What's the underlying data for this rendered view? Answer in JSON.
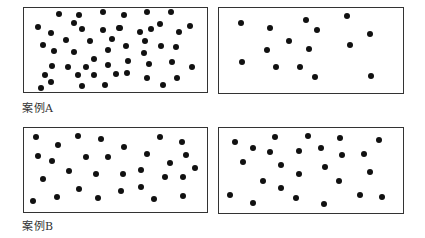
{
  "cases": [
    {
      "label": "案例A",
      "label_pos": [
        22,
        99
      ],
      "panels": [
        {
          "name": "case-a-dense",
          "box": [
            23,
            7,
            185,
            86
          ],
          "dots": [
            [
              59,
              14
            ],
            [
              79,
              15
            ],
            [
              103,
              12
            ],
            [
              124,
              15
            ],
            [
              147,
              12
            ],
            [
              171,
              12
            ],
            [
              38,
              27
            ],
            [
              74,
              23
            ],
            [
              82,
              29
            ],
            [
              103,
              30
            ],
            [
              119,
              28
            ],
            [
              120,
              28
            ],
            [
              140,
              32
            ],
            [
              151,
              29
            ],
            [
              160,
              24
            ],
            [
              179,
              32
            ],
            [
              190,
              26
            ],
            [
              51,
              33
            ],
            [
              66,
              40
            ],
            [
              90,
              41
            ],
            [
              112,
              39
            ],
            [
              145,
              41
            ],
            [
              43,
              45
            ],
            [
              54,
              51
            ],
            [
              74,
              52
            ],
            [
              108,
              50
            ],
            [
              126,
              46
            ],
            [
              161,
              46
            ],
            [
              176,
              47
            ],
            [
              144,
              53
            ],
            [
              94,
              59
            ],
            [
              52,
              66
            ],
            [
              68,
              67
            ],
            [
              86,
              67
            ],
            [
              108,
              65
            ],
            [
              128,
              61
            ],
            [
              149,
              64
            ],
            [
              172,
              62
            ],
            [
              192,
              67
            ],
            [
              45,
              75
            ],
            [
              78,
              75
            ],
            [
              94,
              75
            ],
            [
              116,
              74
            ],
            [
              127,
              73
            ],
            [
              147,
              78
            ],
            [
              177,
              78
            ],
            [
              51,
              82
            ],
            [
              41,
              88
            ],
            [
              82,
              86
            ],
            [
              105,
              85
            ],
            [
              163,
              85
            ]
          ]
        },
        {
          "name": "case-a-sparse",
          "box": [
            218,
            7,
            186,
            87
          ],
          "dots": [
            [
              241,
              23
            ],
            [
              270,
              28
            ],
            [
              306,
              20
            ],
            [
              317,
              30
            ],
            [
              347,
              16
            ],
            [
              370,
              34
            ],
            [
              289,
              41
            ],
            [
              267,
              50
            ],
            [
              309,
              49
            ],
            [
              350,
              45
            ],
            [
              242,
              62
            ],
            [
              276,
              67
            ],
            [
              300,
              67
            ],
            [
              315,
              77
            ],
            [
              371,
              76
            ]
          ]
        }
      ]
    },
    {
      "label": "案例B",
      "label_pos": [
        22,
        217
      ],
      "panels": [
        {
          "name": "case-b-left",
          "box": [
            23,
            127,
            185,
            86
          ],
          "dots": [
            [
              36,
              137
            ],
            [
              78,
              136
            ],
            [
              101,
              139
            ],
            [
              160,
              137
            ],
            [
              182,
              142
            ],
            [
              58,
              145
            ],
            [
              124,
              147
            ],
            [
              38,
              156
            ],
            [
              86,
              157
            ],
            [
              108,
              157
            ],
            [
              147,
              154
            ],
            [
              186,
              155
            ],
            [
              52,
              161
            ],
            [
              170,
              163
            ],
            [
              69,
              171
            ],
            [
              96,
              174
            ],
            [
              123,
              174
            ],
            [
              141,
              170
            ],
            [
              195,
              168
            ],
            [
              43,
              179
            ],
            [
              165,
              177
            ],
            [
              183,
              177
            ],
            [
              79,
              189
            ],
            [
              121,
              191
            ],
            [
              141,
              187
            ],
            [
              33,
              201
            ],
            [
              57,
              197
            ],
            [
              98,
              198
            ],
            [
              154,
              199
            ],
            [
              183,
              196
            ]
          ]
        },
        {
          "name": "case-b-right",
          "box": [
            218,
            127,
            186,
            87
          ],
          "dots": [
            [
              235,
              142
            ],
            [
              275,
              137
            ],
            [
              308,
              136
            ],
            [
              340,
              138
            ],
            [
              379,
              140
            ],
            [
              253,
              148
            ],
            [
              270,
              152
            ],
            [
              299,
              151
            ],
            [
              321,
              148
            ],
            [
              342,
              155
            ],
            [
              364,
              154
            ],
            [
              243,
              162
            ],
            [
              281,
              165
            ],
            [
              325,
              167
            ],
            [
              299,
              174
            ],
            [
              370,
              172
            ],
            [
              263,
              181
            ],
            [
              339,
              181
            ],
            [
              281,
              188
            ],
            [
              230,
              195
            ],
            [
              360,
              195
            ],
            [
              382,
              197
            ],
            [
              253,
              203
            ],
            [
              296,
              198
            ],
            [
              324,
              204
            ]
          ]
        }
      ]
    }
  ],
  "colors": {
    "dot": "#111111",
    "border": "#333333",
    "background": "#ffffff",
    "caption": "#333333"
  }
}
